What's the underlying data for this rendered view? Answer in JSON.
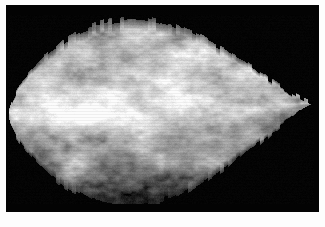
{
  "figure": {
    "kind": "grayscale-micrograph",
    "caption": "",
    "frame": {
      "background_color": "#030303",
      "page_color": "#ffffff",
      "left": 6,
      "top": 5,
      "width": 313,
      "height": 207
    },
    "specimen": {
      "name": "particle-surface",
      "shape": "lens",
      "edge_style": "serrated",
      "surface_texture": "granular-mottled",
      "left_tip_x": 2,
      "right_tip_x": 308,
      "vertical_center": 104,
      "max_height": 189,
      "tone_light": "#e8e8e8",
      "tone_mid": "#a8a8a8",
      "tone_dark": "#4a4a4a",
      "highlight_band_y": 104,
      "illumination": "upper-left"
    },
    "tone_scale": {
      "min": 0,
      "max": 255,
      "background_level": 3,
      "specimen_mean_level": 168,
      "specimen_highlight_level": 238,
      "specimen_shadow_level": 58
    }
  },
  "chart_data": {
    "type": "heatmap",
    "title": "",
    "xlabel": "",
    "ylabel": "",
    "colormap": "grayscale",
    "legend_position": "none",
    "grid": false,
    "note": "Intensity field rendered as a lens-shaped mask with granular noise; values are 0-255 gray levels.",
    "xlim": [
      0,
      306
    ],
    "ylim": [
      0,
      189
    ],
    "regions": [
      {
        "name": "background",
        "level": 3
      },
      {
        "name": "upper-left-lobe",
        "level": 196
      },
      {
        "name": "upper-right-lobe",
        "level": 206
      },
      {
        "name": "central-ridge-highlight",
        "level": 224
      },
      {
        "name": "lower-center-shadow",
        "level": 124
      },
      {
        "name": "lower-left-shadow",
        "level": 132
      },
      {
        "name": "right-tip",
        "level": 188
      }
    ]
  }
}
